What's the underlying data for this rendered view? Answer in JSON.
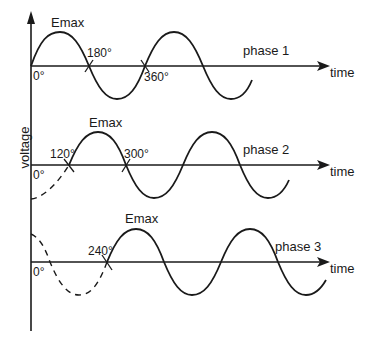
{
  "diagram": {
    "y_axis_label": "voltage",
    "phases": [
      {
        "name": "phase 1",
        "label": "phase 1",
        "time_label": "time",
        "peak_label": "Emax",
        "start_angle": "0°",
        "markers": [
          "0°",
          "180°",
          "360°"
        ],
        "phase_shift_deg": 0
      },
      {
        "name": "phase 2",
        "label": "phase 2",
        "time_label": "time",
        "peak_label": "Emax",
        "start_angle": "0°",
        "markers": [
          "0°",
          "120°",
          "300°"
        ],
        "phase_shift_deg": 120
      },
      {
        "name": "phase 3",
        "label": "phase 3",
        "time_label": "time",
        "peak_label": "Emax",
        "start_angle": "0°",
        "markers": [
          "0°",
          "240°"
        ],
        "phase_shift_deg": 240
      }
    ],
    "colors": {
      "line": "#1a1a1a",
      "background": "#ffffff"
    }
  }
}
